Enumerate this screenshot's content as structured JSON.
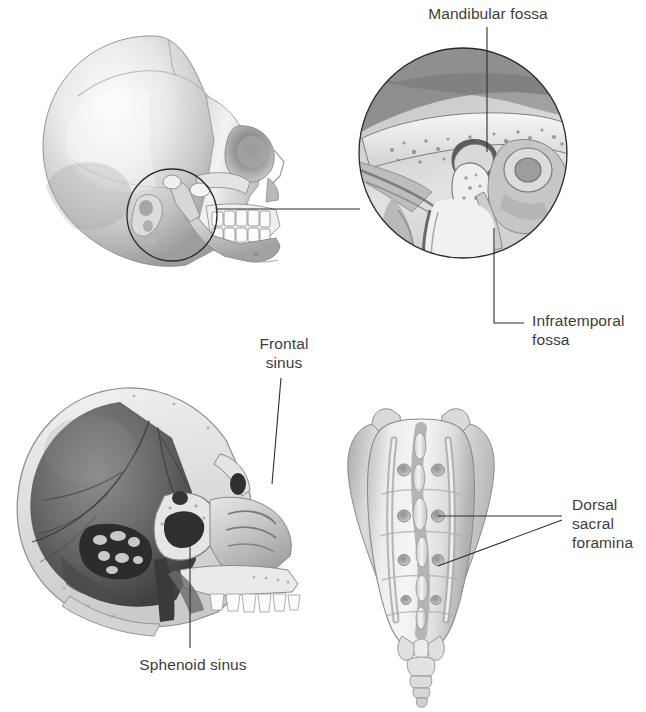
{
  "page": {
    "width": 646,
    "height": 712,
    "background": "#ffffff",
    "text_color": "#3d3d3d",
    "leader_color": "#2e2e2e",
    "title": ""
  },
  "labels": {
    "mandibular_fossa": "Mandibular fossa",
    "infratemporal_fossa": "Infratemporal\nfossa",
    "frontal_sinus": "Frontal\nsinus",
    "sphenoid_sinus": "Sphenoid sinus",
    "dorsal_sacral_foramina": "Dorsal\nsacral\nforamina"
  },
  "figures": [
    {
      "id": "lateral-skull",
      "name": "lateral-skull-view",
      "caption": "",
      "region": {
        "x": 20,
        "y": 30,
        "width": 300,
        "height": 265
      },
      "callout_circle": {
        "cx": 172,
        "cy": 215,
        "r": 45
      }
    },
    {
      "id": "tmj-inset",
      "name": "temporomandibular-joint-inset",
      "caption": "",
      "region": {
        "x": 358,
        "y": 48,
        "width": 210,
        "height": 210
      },
      "circle": {
        "cx": 463,
        "cy": 153,
        "r": 104
      }
    },
    {
      "id": "sagittal-skull",
      "name": "midsagittal-skull-section",
      "caption": "",
      "region": {
        "x": 12,
        "y": 382,
        "width": 305,
        "height": 265
      }
    },
    {
      "id": "sacrum",
      "name": "posterior-sacrum-view",
      "caption": "",
      "region": {
        "x": 345,
        "y": 405,
        "width": 185,
        "height": 295
      }
    }
  ],
  "annotations": [
    {
      "name": "mandibular-fossa-label",
      "target": "mandibular fossa",
      "leader": "vertical"
    },
    {
      "name": "infratemporal-fossa-label",
      "target": "infratemporal fossa",
      "leader": "elbow"
    },
    {
      "name": "frontal-sinus-label",
      "target": "frontal sinus",
      "leader": "slanted"
    },
    {
      "name": "sphenoid-sinus-label",
      "target": "sphenoid sinus",
      "leader": "vertical"
    },
    {
      "name": "dorsal-sacral-foramina-label",
      "target": "dorsal sacral foramina",
      "leader": "double"
    }
  ]
}
